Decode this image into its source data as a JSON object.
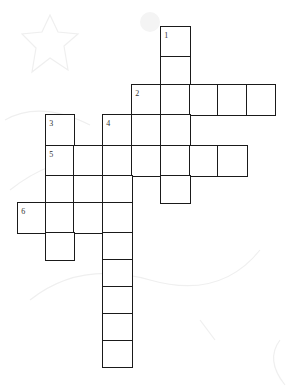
{
  "puzzle": {
    "type": "crossword",
    "colors": {
      "cell_border": "#1a1a1a",
      "cell_fill": "#ffffff",
      "number": "#333333",
      "background": "#ffffff",
      "decoration": "#eeeeee"
    },
    "clue_numbers": [
      "1",
      "2",
      "3",
      "4",
      "5",
      "6"
    ],
    "entries": [
      {
        "number": "1",
        "direction": "down",
        "length": 6
      },
      {
        "number": "2",
        "direction": "across",
        "length": 5
      },
      {
        "number": "3",
        "direction": "down",
        "length": 5
      },
      {
        "number": "4",
        "direction": "down",
        "length": 9
      },
      {
        "number": "5",
        "direction": "across",
        "length": 7
      },
      {
        "number": "6",
        "direction": "across",
        "length": 4
      }
    ],
    "cells": [
      {
        "col": 5,
        "row": 0,
        "number": "1",
        "value": ""
      },
      {
        "col": 5,
        "row": 1,
        "value": ""
      },
      {
        "col": 4,
        "row": 2,
        "number": "2",
        "value": ""
      },
      {
        "col": 5,
        "row": 2,
        "value": ""
      },
      {
        "col": 6,
        "row": 2,
        "value": ""
      },
      {
        "col": 7,
        "row": 2,
        "value": ""
      },
      {
        "col": 8,
        "row": 2,
        "value": ""
      },
      {
        "col": 1,
        "row": 3,
        "number": "3",
        "value": ""
      },
      {
        "col": 3,
        "row": 3,
        "number": "4",
        "value": ""
      },
      {
        "col": 4,
        "row": 3,
        "value": ""
      },
      {
        "col": 5,
        "row": 3,
        "value": ""
      },
      {
        "col": 1,
        "row": 4,
        "number": "5",
        "value": ""
      },
      {
        "col": 2,
        "row": 4,
        "value": ""
      },
      {
        "col": 3,
        "row": 4,
        "value": ""
      },
      {
        "col": 4,
        "row": 4,
        "value": ""
      },
      {
        "col": 5,
        "row": 4,
        "value": ""
      },
      {
        "col": 6,
        "row": 4,
        "value": ""
      },
      {
        "col": 7,
        "row": 4,
        "value": ""
      },
      {
        "col": 1,
        "row": 5,
        "value": ""
      },
      {
        "col": 2,
        "row": 5,
        "value": ""
      },
      {
        "col": 3,
        "row": 5,
        "value": ""
      },
      {
        "col": 5,
        "row": 5,
        "value": ""
      },
      {
        "col": 0,
        "row": 6,
        "number": "6",
        "value": ""
      },
      {
        "col": 1,
        "row": 6,
        "value": ""
      },
      {
        "col": 2,
        "row": 6,
        "value": ""
      },
      {
        "col": 3,
        "row": 6,
        "value": ""
      },
      {
        "col": 1,
        "row": 7,
        "value": ""
      },
      {
        "col": 3,
        "row": 7,
        "value": ""
      },
      {
        "col": 3,
        "row": 8,
        "value": ""
      },
      {
        "col": 3,
        "row": 9,
        "value": ""
      },
      {
        "col": 3,
        "row": 10,
        "value": ""
      },
      {
        "col": 3,
        "row": 11,
        "value": ""
      }
    ]
  }
}
